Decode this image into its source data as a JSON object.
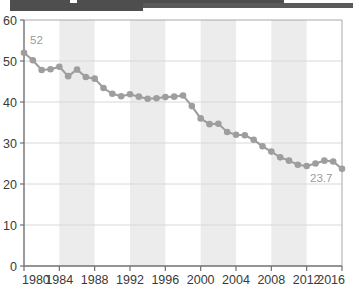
{
  "topbar": {
    "name": "cropped-header-bar",
    "color": "#4e4e4e"
  },
  "chart_data": {
    "type": "line",
    "title": "",
    "subtitle": "",
    "xlabel": "",
    "ylabel": "",
    "xlim": [
      1980,
      2016
    ],
    "ylim": [
      0,
      60
    ],
    "ytick_step": 10,
    "xtick_step": 4,
    "grid": true,
    "legend": null,
    "marker": "circle",
    "line_style": "dotted",
    "series_color": "#9e9e9e",
    "band_color": "#ececec",
    "yticks": [
      "0",
      "10",
      "20",
      "30",
      "40",
      "50",
      "60"
    ],
    "xticks": [
      "1980",
      "1984",
      "1988",
      "1992",
      "1996",
      "2000",
      "2004",
      "2008",
      "2012",
      "2016"
    ],
    "shaded_bands": [
      {
        "from": 1984,
        "to": 1988
      },
      {
        "from": 1992,
        "to": 1996
      },
      {
        "from": 2000,
        "to": 2004
      },
      {
        "from": 2008,
        "to": 2012
      }
    ],
    "annotations": [
      {
        "text": "52",
        "x": 1980,
        "y": 52,
        "dx": 6,
        "dy": -9
      },
      {
        "text": "23.7",
        "x": 2016,
        "y": 23.7,
        "dx": -32,
        "dy": 13
      }
    ],
    "x": [
      1980,
      1981,
      1982,
      1983,
      1984,
      1985,
      1986,
      1987,
      1988,
      1989,
      1990,
      1991,
      1992,
      1993,
      1994,
      1995,
      1996,
      1997,
      1998,
      1999,
      2000,
      2001,
      2002,
      2003,
      2004,
      2005,
      2006,
      2007,
      2008,
      2009,
      2010,
      2011,
      2012,
      2013,
      2014,
      2015,
      2016
    ],
    "values": [
      52.0,
      50.2,
      47.8,
      48.0,
      48.6,
      46.3,
      47.9,
      46.1,
      45.7,
      43.4,
      42.0,
      41.4,
      41.9,
      41.3,
      40.8,
      40.9,
      41.2,
      41.3,
      41.6,
      39.0,
      36.0,
      34.6,
      34.7,
      32.7,
      32.0,
      31.9,
      30.8,
      29.2,
      27.9,
      26.5,
      25.7,
      24.7,
      24.4,
      25.0,
      25.7,
      25.5,
      23.7
    ]
  }
}
